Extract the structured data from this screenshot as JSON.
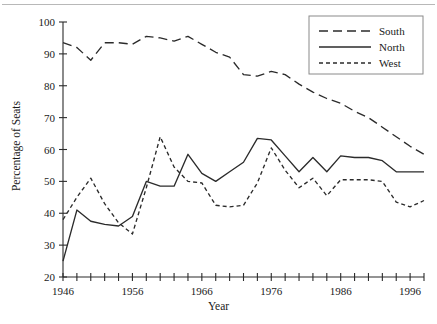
{
  "figure": {
    "has_top_rule": true,
    "background": "#ffffff",
    "line_color": "#2b2b2b"
  },
  "chart_data": {
    "type": "line",
    "title": "",
    "xlabel": "Year",
    "ylabel": "Percentage of Seats",
    "xlim": [
      1946,
      1998
    ],
    "ylim": [
      20,
      100
    ],
    "ytick_step": 10,
    "yticks": [
      20,
      30,
      40,
      50,
      60,
      70,
      80,
      90,
      100
    ],
    "xticks_major": [
      1946,
      1956,
      1966,
      1976,
      1986,
      1996
    ],
    "xtick_minor_step": 2,
    "grid": false,
    "legend_position": "top-right",
    "x": [
      1946,
      1948,
      1950,
      1952,
      1954,
      1956,
      1958,
      1960,
      1962,
      1964,
      1966,
      1968,
      1970,
      1972,
      1974,
      1976,
      1978,
      1980,
      1982,
      1984,
      1986,
      1988,
      1990,
      1992,
      1994,
      1996,
      1998
    ],
    "series": [
      {
        "name": "South",
        "style": "long-dash",
        "values": [
          93.5,
          92.0,
          88.0,
          93.5,
          93.5,
          93.0,
          95.5,
          95.0,
          94.0,
          95.5,
          93.0,
          90.5,
          89.0,
          83.5,
          83.0,
          84.5,
          83.5,
          80.5,
          78.0,
          76.0,
          74.5,
          72.0,
          70.0,
          67.0,
          64.0,
          61.0,
          58.5
        ]
      },
      {
        "name": "North",
        "style": "solid",
        "values": [
          25.0,
          41.0,
          37.5,
          36.5,
          36.0,
          39.0,
          50.0,
          48.5,
          48.5,
          58.5,
          52.5,
          50.0,
          53.0,
          56.0,
          63.5,
          63.0,
          58.0,
          53.0,
          57.5,
          53.0,
          58.0,
          57.5,
          57.5,
          56.5,
          53.0,
          53.0,
          53.0
        ]
      },
      {
        "name": "West",
        "style": "short-dash",
        "values": [
          38.0,
          45.0,
          51.0,
          43.0,
          37.0,
          33.5,
          48.0,
          64.0,
          54.5,
          50.0,
          49.5,
          42.5,
          42.0,
          42.5,
          49.5,
          60.5,
          53.5,
          48.0,
          51.0,
          45.5,
          50.5,
          50.5,
          50.5,
          50.0,
          43.5,
          42.0,
          44.0
        ]
      }
    ]
  },
  "legend": {
    "entries": [
      {
        "label": "South"
      },
      {
        "label": "North"
      },
      {
        "label": "West"
      }
    ]
  },
  "axis": {
    "xlabel": "Year",
    "ylabel": "Percentage of Seats",
    "ytick_labels": [
      "20",
      "30",
      "40",
      "50",
      "60",
      "70",
      "80",
      "90",
      "100"
    ],
    "xtick_labels": [
      "1946",
      "1956",
      "1966",
      "1976",
      "1986",
      "1996"
    ]
  }
}
